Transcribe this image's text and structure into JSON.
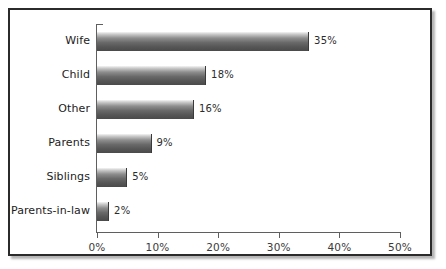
{
  "chart_data": {
    "type": "bar",
    "orientation": "horizontal",
    "title": "",
    "subtitle": "",
    "xlabel": "",
    "ylabel": "",
    "categories": [
      "Wife",
      "Child",
      "Other",
      "Parents",
      "Siblings",
      "Parents-in-law"
    ],
    "values": [
      35,
      18,
      16,
      9,
      5,
      2
    ],
    "value_labels": [
      "35%",
      "18%",
      "16%",
      "9%",
      "5%",
      "2%"
    ],
    "xlim": [
      0,
      50
    ],
    "xticks": [
      0,
      10,
      20,
      30,
      40,
      50
    ],
    "xtick_labels": [
      "0%",
      "10%",
      "20%",
      "30%",
      "40%",
      "50%"
    ],
    "grid": false,
    "legend": null,
    "series": [
      {
        "name": "",
        "values": [
          35,
          18,
          16,
          9,
          5,
          2
        ]
      }
    ],
    "bar_fill": "#6a6a6a",
    "bar_edge": "#3a3a3a",
    "axis_color": "#5f5f5f",
    "frame_color": "#2b2b2b",
    "background": "#ffffff"
  }
}
